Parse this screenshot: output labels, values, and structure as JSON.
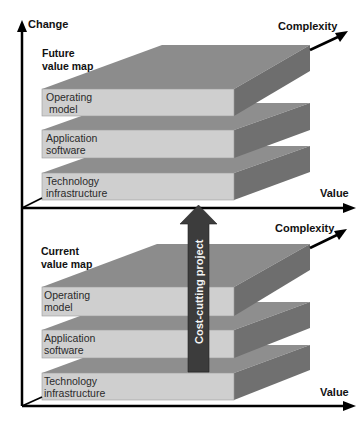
{
  "diagram": {
    "colors": {
      "front_face": "#cfcfcf",
      "top_face": "#8c8c8c",
      "top_face_inner": "#9a9a9a",
      "side_face": "#6e6e6e",
      "axis": "#000000",
      "arrow": "#3c3c3c"
    },
    "axes": {
      "vertical_label": "Change",
      "horizontal_label_top": "Value",
      "depth_label_top": "Complexity",
      "horizontal_label_bottom": "Value",
      "depth_label_bottom": "Complexity"
    },
    "future_map": {
      "title_line1": "Future",
      "title_line2": "value map",
      "layers": [
        {
          "line1": "Operating",
          "line2": " model"
        },
        {
          "line1": "Application",
          "line2": "software"
        },
        {
          "line1": "Technology",
          "line2": "infrastructure"
        }
      ]
    },
    "current_map": {
      "title_line1": "Current",
      "title_line2": "value map",
      "layers": [
        {
          "line1": "Operating",
          "line2": "model"
        },
        {
          "line1": "Application",
          "line2": "software"
        },
        {
          "line1": "Technology",
          "line2": "infrastructure"
        }
      ]
    },
    "transition_arrow": {
      "label": "Cost-cutting project"
    }
  }
}
